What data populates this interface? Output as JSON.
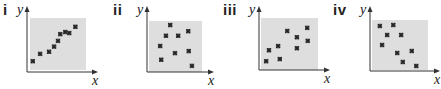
{
  "figure": {
    "panels": [
      {
        "label": "i",
        "x_axis_label": "x",
        "y_axis_label": "y"
      },
      {
        "label": "ii",
        "x_axis_label": "x",
        "y_axis_label": "y"
      },
      {
        "label": "iii",
        "x_axis_label": "x",
        "y_axis_label": "y"
      },
      {
        "label": "iv",
        "x_axis_label": "x",
        "y_axis_label": "y"
      }
    ],
    "colors": {
      "plot_background": "#dedede",
      "axis": "#333333",
      "marker": "#222222"
    }
  },
  "chart_data": [
    {
      "type": "scatter",
      "title": "i",
      "xlabel": "x",
      "ylabel": "y",
      "grid": false,
      "correlation": "strong positive",
      "points": [
        [
          0.05,
          0.17
        ],
        [
          0.18,
          0.31
        ],
        [
          0.34,
          0.35
        ],
        [
          0.43,
          0.45
        ],
        [
          0.5,
          0.56
        ],
        [
          0.54,
          0.69
        ],
        [
          0.63,
          0.73
        ],
        [
          0.7,
          0.71
        ],
        [
          0.81,
          0.83
        ]
      ]
    },
    {
      "type": "scatter",
      "title": "ii",
      "xlabel": "x",
      "ylabel": "y",
      "grid": false,
      "correlation": "none",
      "points": [
        [
          0.4,
          0.92
        ],
        [
          0.32,
          0.71
        ],
        [
          0.55,
          0.71
        ],
        [
          0.74,
          0.8
        ],
        [
          0.21,
          0.51
        ],
        [
          0.49,
          0.37
        ],
        [
          0.75,
          0.41
        ],
        [
          0.23,
          0.24
        ],
        [
          0.81,
          0.12
        ]
      ]
    },
    {
      "type": "scatter",
      "title": "iii",
      "xlabel": "x",
      "ylabel": "y",
      "grid": false,
      "correlation": "weak positive",
      "points": [
        [
          0.09,
          0.17
        ],
        [
          0.14,
          0.38
        ],
        [
          0.3,
          0.46
        ],
        [
          0.46,
          0.75
        ],
        [
          0.63,
          0.63
        ],
        [
          0.81,
          0.81
        ],
        [
          0.82,
          0.56
        ],
        [
          0.63,
          0.42
        ],
        [
          0.33,
          0.21
        ]
      ]
    },
    {
      "type": "scatter",
      "title": "iv",
      "xlabel": "x",
      "ylabel": "y",
      "grid": false,
      "correlation": "negative",
      "points": [
        [
          0.14,
          0.88
        ],
        [
          0.38,
          0.9
        ],
        [
          0.27,
          0.7
        ],
        [
          0.52,
          0.7
        ],
        [
          0.18,
          0.5
        ],
        [
          0.45,
          0.34
        ],
        [
          0.71,
          0.38
        ],
        [
          0.55,
          0.16
        ],
        [
          0.79,
          0.08
        ]
      ]
    }
  ]
}
